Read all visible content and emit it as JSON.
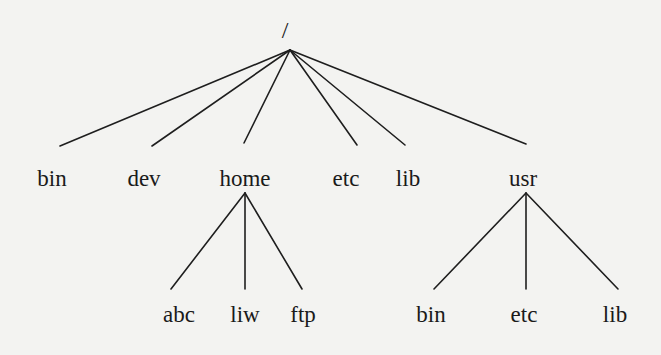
{
  "diagram": {
    "type": "directory-tree",
    "root": {
      "label": "/",
      "x": 285,
      "y": 18,
      "apex": [
        290,
        50
      ]
    },
    "level1": [
      {
        "label": "bin",
        "x": 52,
        "y": 167,
        "edge_end": [
          60,
          146
        ]
      },
      {
        "label": "dev",
        "x": 144,
        "y": 167,
        "edge_end": [
          152,
          146
        ]
      },
      {
        "label": "home",
        "x": 245,
        "y": 167,
        "edge_end": [
          244,
          143
        ]
      },
      {
        "label": "etc",
        "x": 346,
        "y": 167,
        "edge_end": [
          357,
          145
        ]
      },
      {
        "label": "lib",
        "x": 408,
        "y": 167,
        "edge_end": [
          405,
          145
        ]
      },
      {
        "label": "usr",
        "x": 523,
        "y": 167,
        "edge_end": [
          526,
          144
        ]
      }
    ],
    "home_children": {
      "apex": [
        245,
        193
      ],
      "items": [
        {
          "label": "abc",
          "x": 179,
          "y": 303,
          "edge_end": [
            171,
            289
          ]
        },
        {
          "label": "liw",
          "x": 245,
          "y": 303,
          "edge_end": [
            245,
            289
          ]
        },
        {
          "label": "ftp",
          "x": 303,
          "y": 303,
          "edge_end": [
            302,
            289
          ]
        }
      ]
    },
    "usr_children": {
      "apex": [
        526,
        193
      ],
      "items": [
        {
          "label": "bin",
          "x": 431,
          "y": 303,
          "edge_end": [
            434,
            289
          ]
        },
        {
          "label": "etc",
          "x": 524,
          "y": 303,
          "edge_end": [
            526,
            289
          ]
        },
        {
          "label": "lib",
          "x": 615,
          "y": 303,
          "edge_end": [
            618,
            289
          ]
        }
      ]
    },
    "colors": {
      "line": "#1e1e1e",
      "text": "#1a1a1a",
      "background": "#f3f3f1"
    }
  }
}
